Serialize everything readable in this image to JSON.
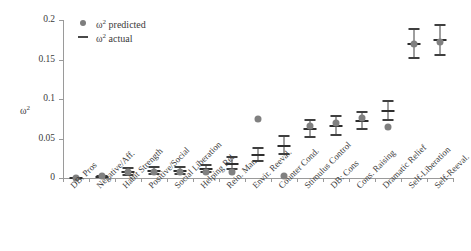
{
  "chart_data": {
    "type": "scatter",
    "title": "",
    "xlabel": "",
    "ylabel": "ω²",
    "ylim": [
      0,
      0.2
    ],
    "yticks": [
      0,
      0.05,
      0.1,
      0.15,
      0.2
    ],
    "ytick_labels": [
      "0",
      "0.05",
      "0.1",
      "0.15",
      "0.2"
    ],
    "grid": false,
    "legend_position": "top-left",
    "legend": [
      {
        "label": "ω² predicted",
        "marker": "filled-circle",
        "color": "#7d7d7d"
      },
      {
        "label": "ω² actual",
        "marker": "dash",
        "color": "#4a4a4a"
      }
    ],
    "categories": [
      "DB. Pros",
      "Negative/Aff.",
      "Habit Strength",
      "Positive/Social",
      "Social Liberation",
      "Helping Rel.",
      "Rein. Man.",
      "Envir. Reeval.",
      "Counter Cond.",
      "Stimulus Control",
      "DB: Cons",
      "Cons. Raising",
      "Dramatic Relief",
      "Self-Liberation",
      "Self-Reeval."
    ],
    "series": [
      {
        "name": "ω² predicted",
        "marker": "filled-circle",
        "values": [
          0.0,
          0.003,
          0.007,
          0.008,
          0.008,
          0.008,
          0.008,
          0.075,
          0.002,
          0.066,
          0.069,
          0.076,
          0.065,
          0.17,
          0.172
        ]
      },
      {
        "name": "ω² actual",
        "marker": "dash-with-errorbar",
        "values": [
          0.0,
          0.001,
          0.008,
          0.009,
          0.009,
          0.011,
          0.018,
          0.029,
          0.041,
          0.062,
          0.066,
          0.072,
          0.085,
          0.17,
          0.175
        ],
        "err_low": [
          0.0,
          0.001,
          0.004,
          0.005,
          0.005,
          0.007,
          0.011,
          0.021,
          0.03,
          0.052,
          0.055,
          0.062,
          0.074,
          0.152,
          0.156
        ],
        "err_high": [
          0.0,
          0.002,
          0.013,
          0.014,
          0.014,
          0.016,
          0.026,
          0.038,
          0.053,
          0.073,
          0.078,
          0.083,
          0.097,
          0.189,
          0.194
        ]
      }
    ]
  }
}
